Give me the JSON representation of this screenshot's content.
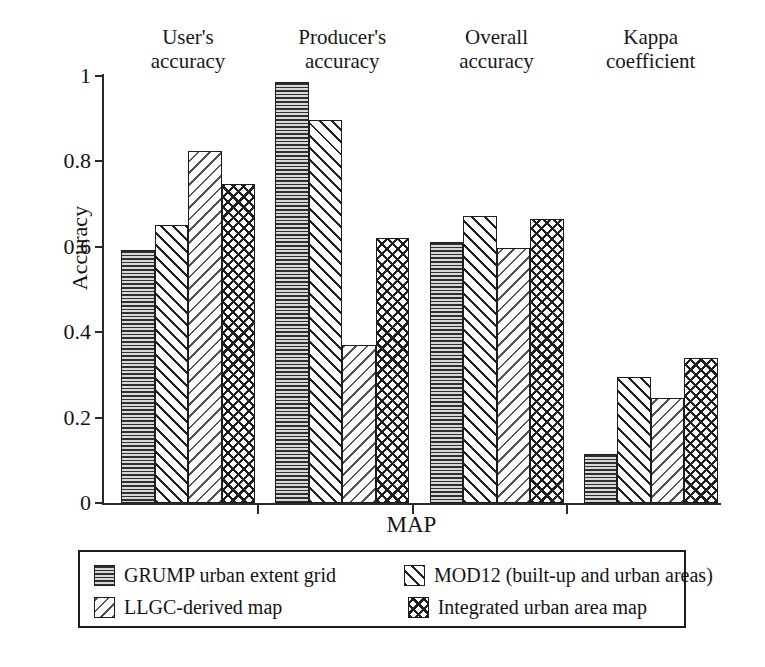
{
  "chart_data": {
    "type": "bar",
    "title": "",
    "xlabel": "MAP",
    "ylabel": "Accuracy",
    "ylim": [
      0,
      1
    ],
    "ytick_labels": [
      "1",
      "0.8",
      "0.6",
      "0.4",
      "0.2",
      "0"
    ],
    "ytick_values": [
      1,
      0.8,
      0.6,
      0.4,
      0.2,
      0
    ],
    "grid": false,
    "legend_position": "below-plot",
    "categories": [
      "User's accuracy",
      "Producer's accuracy",
      "Overall accuracy",
      "Kappa coefficient"
    ],
    "category_lines": [
      [
        "User's",
        "accuracy"
      ],
      [
        "Producer's",
        "accuracy"
      ],
      [
        "Overall",
        "accuracy"
      ],
      [
        "Kappa",
        "coefficient"
      ]
    ],
    "series": [
      {
        "name": "GRUMP urban extent grid",
        "pattern": "horizontal-lines",
        "values": [
          0.593,
          0.985,
          0.611,
          0.115
        ]
      },
      {
        "name": "MOD12 (built-up and urban areas)",
        "pattern": "diagonal-forward",
        "values": [
          0.652,
          0.897,
          0.672,
          0.296
        ]
      },
      {
        "name": "LLGC-derived map",
        "pattern": "diagonal-backward",
        "values": [
          0.824,
          0.369,
          0.598,
          0.246
        ]
      },
      {
        "name": "Integrated urban area map",
        "pattern": "crosshatch",
        "values": [
          0.746,
          0.62,
          0.665,
          0.34
        ]
      }
    ]
  },
  "legend": {
    "entries": [
      {
        "label": "GRUMP urban extent grid",
        "pattern": "horizontal-lines"
      },
      {
        "label": "MOD12 (built-up and urban areas)",
        "pattern": "diagonal-forward"
      },
      {
        "label": "LLGC-derived map",
        "pattern": "diagonal-backward"
      },
      {
        "label": "Integrated urban area map",
        "pattern": "crosshatch"
      }
    ]
  },
  "colors": {
    "axis": "#2a2a2a",
    "text": "#141414",
    "bar_outline": "#1d1d1d",
    "background": "#ffffff"
  }
}
